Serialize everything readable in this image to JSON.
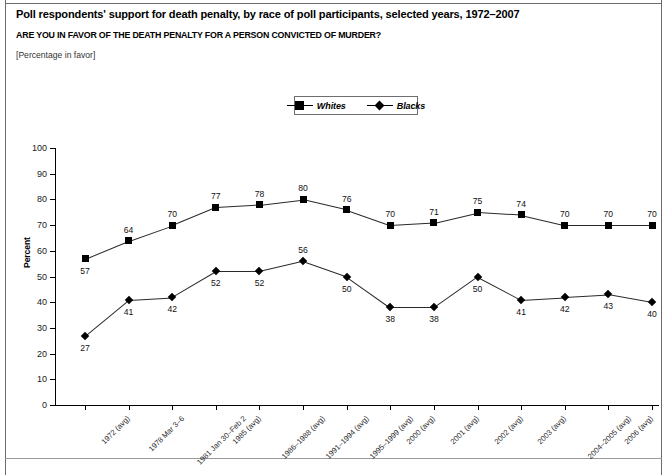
{
  "document": {
    "title": "Poll respondents' support for death penalty, by race of poll participants, selected years, 1972–2007",
    "question": "ARE YOU IN FAVOR OF THE DEATH PENALTY FOR A PERSON CONVICTED OF MURDER?",
    "units": "[Percentage in favor]"
  },
  "legend": {
    "position": "top-center",
    "entries": [
      {
        "label": "Whites",
        "marker": "square",
        "color": "#000000"
      },
      {
        "label": "Blacks",
        "marker": "diamond",
        "color": "#000000"
      }
    ]
  },
  "chart_data": {
    "type": "line",
    "title": "Poll respondents' support for death penalty, by race of poll participants, selected years, 1972–2007",
    "subtitle": "ARE YOU IN FAVOR OF THE DEATH PENALTY FOR A PERSON CONVICTED OF MURDER?",
    "xlabel": "",
    "ylabel": "Percent",
    "ylim": [
      0,
      100
    ],
    "yticks": [
      0,
      10,
      20,
      30,
      40,
      50,
      60,
      70,
      80,
      90,
      100
    ],
    "grid": false,
    "legend_position": "top-center",
    "categories": [
      "1972 (avg)",
      "1978 Mar 3–6",
      "1981 Jan 30–Feb 2",
      "1985 (avg)",
      "1986–1988 (avg)",
      "1991–1994 (avg)",
      "1995–1999 (avg)",
      "2000 (avg)",
      "2001 (avg)",
      "2002 (avg)",
      "2003 (avg)",
      "2004–2005 (avg)",
      "2006 (avg)",
      "2007 Jun 4–24"
    ],
    "series": [
      {
        "name": "Whites",
        "marker": "square",
        "values": [
          57,
          64,
          70,
          77,
          78,
          80,
          76,
          70,
          71,
          75,
          74,
          70,
          70,
          70
        ],
        "label_positions": [
          "below",
          "above",
          "above",
          "above",
          "above",
          "above",
          "above",
          "above",
          "above",
          "above",
          "above",
          "above",
          "above",
          "above"
        ]
      },
      {
        "name": "Blacks",
        "marker": "diamond",
        "values": [
          27,
          41,
          42,
          52,
          52,
          56,
          50,
          38,
          38,
          50,
          41,
          42,
          43,
          40
        ],
        "label_positions": [
          "below",
          "below",
          "below",
          "below",
          "below",
          "above",
          "below",
          "below",
          "below",
          "below",
          "below",
          "below",
          "below",
          "below"
        ]
      }
    ]
  }
}
